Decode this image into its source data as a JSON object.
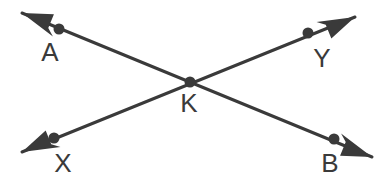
{
  "diagram": {
    "type": "geometry-line-diagram",
    "background_color": "#ffffff",
    "stroke_color": "#3a3a3a",
    "label_color": "#3a3a3a",
    "stroke_width": 3,
    "dot_radius": 5.5,
    "width": 384,
    "height": 190,
    "lines": [
      {
        "name": "line-AB",
        "from_label": "A",
        "to_label": "B",
        "start_arrow": true,
        "end_arrow": true,
        "tail": {
          "x": 22,
          "y": 13
        },
        "head": {
          "x": 372,
          "y": 157
        }
      },
      {
        "name": "line-XY",
        "from_label": "X",
        "to_label": "Y",
        "start_arrow": true,
        "end_arrow": true,
        "tail": {
          "x": 22,
          "y": 152
        },
        "head": {
          "x": 355,
          "y": 17
        }
      }
    ],
    "points": [
      {
        "label": "A",
        "dot": {
          "x": 59,
          "y": 29
        },
        "label_pos": {
          "x": 50,
          "y": 52
        }
      },
      {
        "label": "Y",
        "dot": {
          "x": 308,
          "y": 33
        },
        "label_pos": {
          "x": 322,
          "y": 58
        }
      },
      {
        "label": "K",
        "dot": {
          "x": 190,
          "y": 82
        },
        "label_pos": {
          "x": 189,
          "y": 103
        }
      },
      {
        "label": "X",
        "dot": {
          "x": 54,
          "y": 138
        },
        "label_pos": {
          "x": 63,
          "y": 163
        }
      },
      {
        "label": "B",
        "dot": {
          "x": 334,
          "y": 139
        },
        "label_pos": {
          "x": 330,
          "y": 163
        }
      }
    ]
  }
}
